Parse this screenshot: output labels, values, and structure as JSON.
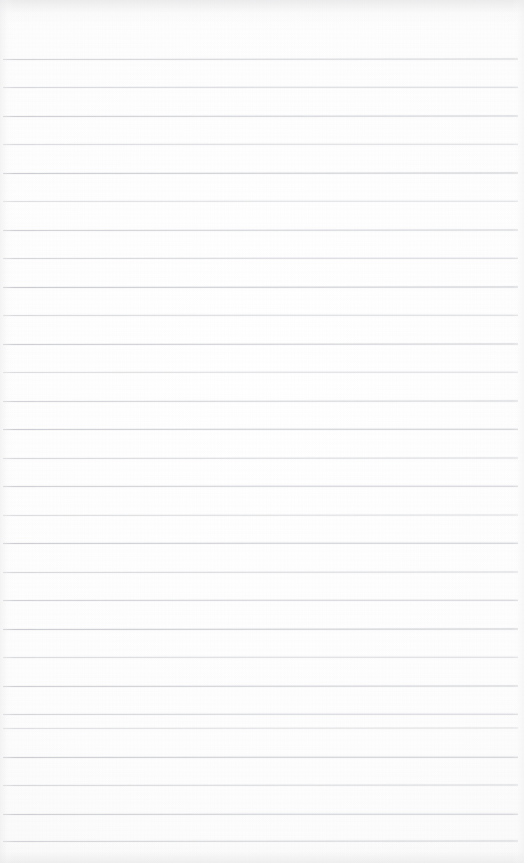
{
  "document": {
    "kind": "scanned-ruled-notebook-page",
    "title": "Blank ruled notebook page",
    "content_text": "",
    "page_width": 524,
    "page_height": 863,
    "paper_color": "#fdfdfd",
    "rule_color": "#b9bcc2",
    "rule_count": 28,
    "first_rule_y": 59,
    "rule_spacing": 28.5,
    "rule_left_x": 3,
    "rule_right_x": 518,
    "top_margin_height": 59,
    "rules": [
      {
        "y": 59,
        "opacity": 0.62,
        "tilt": -0.05
      },
      {
        "y": 87,
        "opacity": 0.55,
        "tilt": -0.04
      },
      {
        "y": 116,
        "opacity": 0.68,
        "tilt": -0.06
      },
      {
        "y": 144,
        "opacity": 0.5,
        "tilt": -0.03
      },
      {
        "y": 173,
        "opacity": 0.72,
        "tilt": -0.05
      },
      {
        "y": 201,
        "opacity": 0.45,
        "tilt": -0.04
      },
      {
        "y": 230,
        "opacity": 0.66,
        "tilt": -0.06
      },
      {
        "y": 258,
        "opacity": 0.58,
        "tilt": -0.04
      },
      {
        "y": 287,
        "opacity": 0.74,
        "tilt": -0.05
      },
      {
        "y": 315,
        "opacity": 0.52,
        "tilt": -0.03
      },
      {
        "y": 344,
        "opacity": 0.69,
        "tilt": -0.05
      },
      {
        "y": 372,
        "opacity": 0.48,
        "tilt": -0.04
      },
      {
        "y": 401,
        "opacity": 0.63,
        "tilt": -0.06
      },
      {
        "y": 429,
        "opacity": 0.7,
        "tilt": -0.04
      },
      {
        "y": 458,
        "opacity": 0.54,
        "tilt": -0.05
      },
      {
        "y": 486,
        "opacity": 0.66,
        "tilt": -0.03
      },
      {
        "y": 515,
        "opacity": 0.47,
        "tilt": -0.05
      },
      {
        "y": 543,
        "opacity": 0.71,
        "tilt": -0.04
      },
      {
        "y": 572,
        "opacity": 0.56,
        "tilt": -0.06
      },
      {
        "y": 600,
        "opacity": 0.64,
        "tilt": -0.04
      },
      {
        "y": 629,
        "opacity": 0.73,
        "tilt": -0.05
      },
      {
        "y": 657,
        "opacity": 0.51,
        "tilt": -0.03
      },
      {
        "y": 686,
        "opacity": 0.67,
        "tilt": -0.05
      },
      {
        "y": 714,
        "opacity": 0.59,
        "tilt": -0.04
      },
      {
        "y": 728,
        "opacity": 0.44,
        "tilt": -0.05
      },
      {
        "y": 757,
        "opacity": 0.7,
        "tilt": -0.04
      },
      {
        "y": 785,
        "opacity": 0.53,
        "tilt": -0.06
      },
      {
        "y": 814,
        "opacity": 0.68,
        "tilt": -0.04
      },
      {
        "y": 841,
        "opacity": 0.61,
        "tilt": -0.05
      }
    ]
  }
}
